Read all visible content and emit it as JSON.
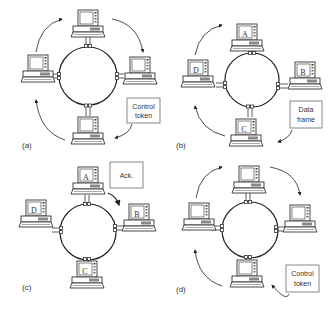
{
  "figure": {
    "panels": [
      {
        "id": "a",
        "label": "(a)",
        "center": [
          88,
          76
        ],
        "stations": [
          {
            "pos": "top",
            "letter": ""
          },
          {
            "pos": "right",
            "letter": ""
          },
          {
            "pos": "bottom",
            "letter": ""
          },
          {
            "pos": "left",
            "letter": ""
          }
        ],
        "callout": {
          "lines": [
            "Control",
            "token"
          ],
          "box": [
            127,
            98,
            33,
            25
          ]
        },
        "arrows": [
          "top-to-right",
          "right-to-bottom-via-callout",
          "bottom-to-left",
          "left-to-top"
        ]
      },
      {
        "id": "b",
        "label": "(b)",
        "center": [
          252,
          80
        ],
        "stations": [
          {
            "pos": "top",
            "letter": "A"
          },
          {
            "pos": "right",
            "letter": "B"
          },
          {
            "pos": "bottom",
            "letter": "C"
          },
          {
            "pos": "left",
            "letter": "D"
          }
        ],
        "callout": {
          "lines": [
            "Data",
            "frame"
          ],
          "box": [
            290,
            101,
            32,
            27
          ]
        },
        "arrows": [
          "left-to-top",
          "bottom-to-left",
          "callout-to-bottom"
        ]
      },
      {
        "id": "c",
        "label": "(c)",
        "center": [
          88,
          232
        ],
        "stations": [
          {
            "pos": "top",
            "letter": "A"
          },
          {
            "pos": "right",
            "letter": "B"
          },
          {
            "pos": "bottom",
            "letter": "C"
          },
          {
            "pos": "left",
            "letter": "D"
          }
        ],
        "callout": {
          "lines": [
            "Ack."
          ],
          "box": [
            110,
            162,
            33,
            26
          ]
        },
        "arrows": [
          "top-to-right"
        ]
      },
      {
        "id": "d",
        "label": "(d)",
        "center": [
          250,
          230
        ],
        "stations": [
          {
            "pos": "top",
            "letter": ""
          },
          {
            "pos": "right",
            "letter": ""
          },
          {
            "pos": "bottom",
            "letter": ""
          },
          {
            "pos": "left",
            "letter": ""
          }
        ],
        "callout": {
          "lines": [
            "Control",
            "token"
          ],
          "box": [
            286,
            265,
            33,
            27
          ]
        },
        "arrows": [
          "top-to-right",
          "right-to-bottom-via-callout",
          "bottom-to-left",
          "left-to-top"
        ]
      }
    ]
  }
}
